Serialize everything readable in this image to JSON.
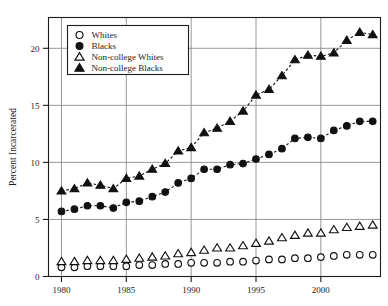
{
  "chart_data": {
    "type": "line",
    "title": "",
    "subtitle": "",
    "xlabel": "",
    "ylabel": "Percent Incarcerated",
    "xlim": [
      1979.0,
      2004.6
    ],
    "ylim": [
      0,
      22.7
    ],
    "xticks": [
      1980,
      1985,
      1990,
      1995,
      2000
    ],
    "xtick_labels": [
      "1980",
      "1985",
      "1990",
      "1995",
      "2000"
    ],
    "yticks": [
      0,
      5,
      10,
      15,
      20
    ],
    "ytick_labels": [
      "0",
      "5",
      "10",
      "15",
      "20"
    ],
    "grid": "both",
    "legend_position": "upper-left-inside",
    "x": [
      1980,
      1981,
      1982,
      1983,
      1984,
      1985,
      1986,
      1987,
      1988,
      1989,
      1990,
      1991,
      1992,
      1993,
      1994,
      1995,
      1996,
      1997,
      1998,
      1999,
      2000,
      2001,
      2002,
      2003,
      2004
    ],
    "series": [
      {
        "name": "Whites",
        "marker": "open-circle",
        "values": [
          0.8,
          0.8,
          0.9,
          0.9,
          0.9,
          0.9,
          1.0,
          1.0,
          1.1,
          1.1,
          1.2,
          1.2,
          1.2,
          1.3,
          1.3,
          1.4,
          1.5,
          1.5,
          1.6,
          1.6,
          1.7,
          1.8,
          1.9,
          1.9,
          1.9
        ]
      },
      {
        "name": "Blacks",
        "marker": "filled-circle",
        "values": [
          5.7,
          5.9,
          6.2,
          6.2,
          6.0,
          6.5,
          6.6,
          7.0,
          7.4,
          8.2,
          8.6,
          9.4,
          9.4,
          9.8,
          9.9,
          10.3,
          10.7,
          11.2,
          12.1,
          12.2,
          12.1,
          12.8,
          13.2,
          13.6,
          13.6
        ]
      },
      {
        "name": "Non-college Whites",
        "marker": "open-triangle",
        "values": [
          1.3,
          1.3,
          1.4,
          1.4,
          1.4,
          1.5,
          1.6,
          1.7,
          1.8,
          2.0,
          2.1,
          2.3,
          2.5,
          2.5,
          2.7,
          2.9,
          3.1,
          3.4,
          3.6,
          3.8,
          3.8,
          4.1,
          4.3,
          4.4,
          4.5
        ]
      },
      {
        "name": "Non-college Blacks",
        "marker": "filled-triangle",
        "values": [
          7.5,
          7.7,
          8.2,
          8.0,
          7.7,
          8.6,
          8.8,
          9.4,
          9.9,
          11.0,
          11.3,
          12.6,
          13.0,
          13.6,
          14.5,
          15.9,
          16.4,
          17.6,
          19.0,
          19.4,
          19.3,
          19.6,
          20.7,
          21.4,
          21.2
        ]
      }
    ]
  },
  "legend": {
    "items": [
      {
        "label": "Whites",
        "marker": "open-circle"
      },
      {
        "label": "Blacks",
        "marker": "filled-circle"
      },
      {
        "label": "Non-college Whites",
        "marker": "open-triangle"
      },
      {
        "label": "Non-college Blacks",
        "marker": "filled-triangle"
      }
    ]
  }
}
